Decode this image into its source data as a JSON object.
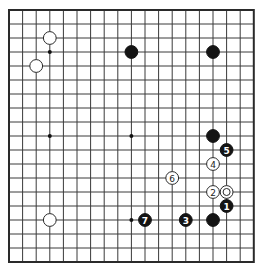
{
  "board": {
    "size": 19,
    "origin_x": 9,
    "origin_y": 10,
    "spacing_x": 13.6,
    "spacing_y": 14.0,
    "stone_radius": 6.4,
    "colors": {
      "line": "#3a3a3a",
      "black_stone": "#141414",
      "white_stone": "#ffffff",
      "background": "#ffffff"
    }
  },
  "star_points_visible": [
    {
      "col": 3,
      "row": 3
    },
    {
      "col": 3,
      "row": 9
    },
    {
      "col": 9,
      "row": 9
    },
    {
      "col": 9,
      "row": 15
    }
  ],
  "stones": [
    {
      "color": "white",
      "col": 3,
      "row": 2,
      "label": ""
    },
    {
      "color": "white",
      "col": 2,
      "row": 4,
      "label": ""
    },
    {
      "color": "white",
      "col": 3,
      "row": 15,
      "label": ""
    },
    {
      "color": "black",
      "col": 9,
      "row": 3,
      "label": ""
    },
    {
      "color": "black",
      "col": 15,
      "row": 3,
      "label": ""
    },
    {
      "color": "black",
      "col": 15,
      "row": 9,
      "label": ""
    },
    {
      "color": "black",
      "col": 15,
      "row": 15,
      "label": ""
    },
    {
      "color": "white",
      "col": 16,
      "row": 13,
      "label": "",
      "marker": "circle"
    },
    {
      "color": "black",
      "col": 16,
      "row": 14,
      "label": "1"
    },
    {
      "color": "white",
      "col": 15,
      "row": 13,
      "label": "2"
    },
    {
      "color": "black",
      "col": 13,
      "row": 15,
      "label": "3"
    },
    {
      "color": "white",
      "col": 15,
      "row": 11,
      "label": "4"
    },
    {
      "color": "black",
      "col": 16,
      "row": 10,
      "label": "5"
    },
    {
      "color": "white",
      "col": 12,
      "row": 12,
      "label": "6"
    },
    {
      "color": "black",
      "col": 10,
      "row": 15,
      "label": "7"
    }
  ]
}
